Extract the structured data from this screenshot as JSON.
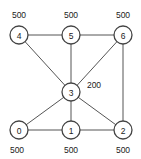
{
  "graph": {
    "nodes": [
      {
        "id": "0",
        "label": "0",
        "value": "500"
      },
      {
        "id": "1",
        "label": "1",
        "value": "500"
      },
      {
        "id": "2",
        "label": "2",
        "value": "500"
      },
      {
        "id": "3",
        "label": "3",
        "value": "200"
      },
      {
        "id": "4",
        "label": "4",
        "value": "500"
      },
      {
        "id": "5",
        "label": "5",
        "value": "500"
      },
      {
        "id": "6",
        "label": "6",
        "value": "500"
      }
    ],
    "edges": [
      [
        "4",
        "5"
      ],
      [
        "5",
        "6"
      ],
      [
        "4",
        "3"
      ],
      [
        "5",
        "3"
      ],
      [
        "6",
        "3"
      ],
      [
        "6",
        "2"
      ],
      [
        "3",
        "0"
      ],
      [
        "3",
        "1"
      ],
      [
        "3",
        "2"
      ],
      [
        "0",
        "1"
      ],
      [
        "1",
        "2"
      ]
    ]
  }
}
